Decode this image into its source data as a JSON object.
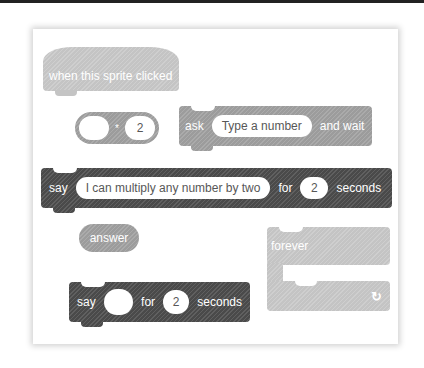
{
  "blocks": {
    "hat": {
      "label": "when this sprite clicked"
    },
    "operator": {
      "left_value": "",
      "operator_symbol": "*",
      "right_value": "2"
    },
    "ask": {
      "prefix": "ask",
      "input": "Type a number",
      "suffix": "and wait"
    },
    "say_long": {
      "prefix": "say",
      "message": "I can multiply any number by two",
      "for_label": "for",
      "seconds_value": "2",
      "seconds_label": "seconds"
    },
    "answer": {
      "label": "answer"
    },
    "forever": {
      "label": "forever",
      "loop_icon": "↻"
    },
    "say_short": {
      "prefix": "say",
      "message": "",
      "for_label": "for",
      "seconds_value": "2",
      "seconds_label": "seconds"
    }
  },
  "colors": {
    "light_block": "#c4c4c4",
    "mid_block": "#9c9c9c",
    "dark_block": "#4a4a4a",
    "slot_text": "#575757"
  }
}
